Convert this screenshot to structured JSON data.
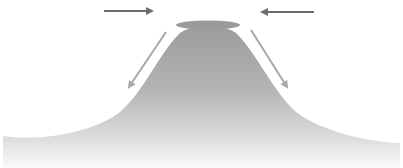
{
  "diagram": {
    "title": "",
    "colors": {
      "background": "#ffffff",
      "mound_top": "#9c9c9c",
      "mound_bottom": "#f4f4f4",
      "cap": "#9a9a9a",
      "horizontal_arrow": "#6e6e6e",
      "diagonal_arrow": "#a8a8a8"
    },
    "arrows": [
      {
        "name": "left-inflow",
        "x1": 104,
        "y1": 11,
        "x2": 156,
        "y2": 11,
        "direction": "right"
      },
      {
        "name": "right-inflow",
        "x1": 314,
        "y1": 12,
        "x2": 258,
        "y2": 12,
        "direction": "left"
      },
      {
        "name": "left-downslope",
        "x1": 166,
        "y1": 32,
        "x2": 127,
        "y2": 90,
        "direction": "down-left"
      },
      {
        "name": "right-downslope",
        "x1": 251,
        "y1": 30,
        "x2": 289,
        "y2": 90,
        "direction": "down-right"
      }
    ],
    "cap": {
      "cx": 208,
      "cy": 25,
      "rx": 32,
      "ry": 4.5
    }
  }
}
